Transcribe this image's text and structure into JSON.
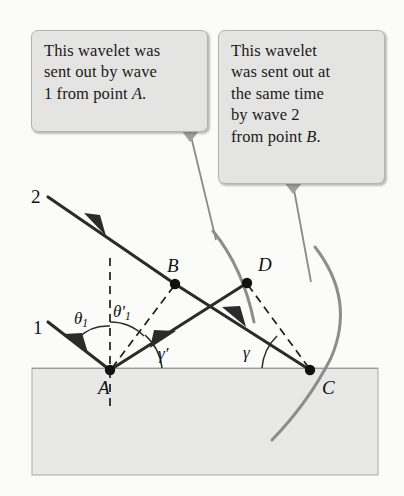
{
  "figure": {
    "background_color": "#fbfbfa"
  },
  "callouts": {
    "left": {
      "id": "callout-wavelet-from-A",
      "lines": [
        "This wavelet was",
        "sent out by wave",
        "1 from point "
      ],
      "trailing_italic": "A",
      "trailing_punct": ".",
      "full_text": "This wavelet was sent out by wave 1 from point A.",
      "fill": "#e4e4e2",
      "stroke": "#b4b4b2"
    },
    "right": {
      "id": "callout-wavelet-from-B",
      "lines": [
        "This wavelet",
        "was sent out at",
        "the same time",
        "by wave 2",
        "from point "
      ],
      "trailing_italic": "B",
      "trailing_punct": ".",
      "full_text": "This wavelet was sent out at the same time by wave 2 from point B.",
      "fill": "#e4e4e2",
      "stroke": "#b4b4b2"
    }
  },
  "points": {
    "A": {
      "label": "A",
      "x": 110,
      "y": 370,
      "label_x": 98,
      "label_y": 378
    },
    "B": {
      "label": "B",
      "x": 175,
      "y": 284,
      "label_x": 167,
      "label_y": 256
    },
    "C": {
      "label": "C",
      "x": 310,
      "y": 370,
      "label_x": 322,
      "label_y": 378
    },
    "D": {
      "label": "D",
      "x": 247,
      "y": 283,
      "label_x": 258,
      "label_y": 255
    }
  },
  "ray_labels": {
    "wave1": {
      "label": "1",
      "x": 33,
      "y": 318
    },
    "wave2": {
      "label": "2",
      "x": 31,
      "y": 187
    }
  },
  "angle_labels": {
    "theta1": {
      "symbol": "θ",
      "sub": "1",
      "prime": "",
      "x": 74,
      "y": 310
    },
    "theta1_prime": {
      "symbol": "θ",
      "sub": "1",
      "prime": "′",
      "x": 113,
      "y": 303
    },
    "gamma_prime": {
      "symbol": "γ",
      "sub": "",
      "prime": "′",
      "x": 158,
      "y": 345
    },
    "gamma": {
      "symbol": "γ",
      "sub": "",
      "prime": "",
      "x": 243,
      "y": 344
    }
  },
  "medium": {
    "name": "reflecting-medium-block",
    "x": 32,
    "y": 368,
    "width": 346,
    "height": 107,
    "fill": "#e8e8e6",
    "stroke": "#aaaaa8"
  },
  "colors": {
    "ray": "#2b2b2b",
    "wavelet_arc": "#8d8d8d",
    "dashed": "#1d1d1d",
    "angle_arc": "#2b2b2b",
    "pointer": "#7d7d7d",
    "surface_line": "#9a9a98"
  },
  "geometry": {
    "wave2_ray": {
      "from": [
        48,
        197
      ],
      "to": [
        310,
        370
      ]
    },
    "wave1_ray": {
      "from": [
        48,
        322
      ],
      "to": [
        110,
        370
      ]
    },
    "reflected_ray": {
      "from": [
        110,
        370
      ],
      "to": [
        247,
        283
      ]
    },
    "normal_line": {
      "from": [
        110,
        258
      ],
      "to": [
        110,
        408
      ]
    },
    "dashed_AB": {
      "from": [
        110,
        370
      ],
      "to": [
        175,
        284
      ]
    },
    "dashed_DC": {
      "from": [
        247,
        283
      ],
      "to": [
        310,
        370
      ]
    },
    "wavelet_arc_A": {
      "center": [
        110,
        370
      ],
      "radius": 163,
      "label": "wavelet radiated from A, passes through D"
    },
    "wavelet_arc_C": {
      "center": [
        310,
        370
      ],
      "radius": 72,
      "label": "wavelet just starting at C"
    }
  }
}
